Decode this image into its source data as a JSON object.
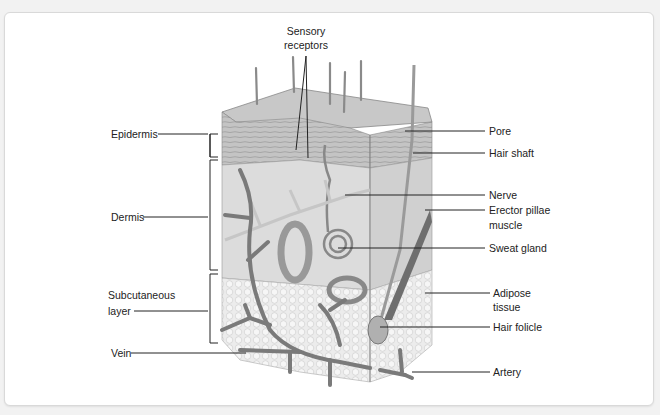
{
  "diagram": {
    "labels": {
      "sensory_receptors_line1": "Sensory",
      "sensory_receptors_line2": "receptors",
      "epidermis": "Epidermis",
      "dermis": "Dermis",
      "subcutaneous_line1": "Subcutaneous",
      "subcutaneous_line2": "layer",
      "vein": "Vein",
      "pore": "Pore",
      "hair_shaft": "Hair shaft",
      "nerve": "Nerve",
      "erector_line1": "Erector pillae",
      "erector_line2": "muscle",
      "sweat_gland": "Sweat gland",
      "adipose_line1": "Adipose",
      "adipose_line2": "tissue",
      "hair_folicle": "Hair folicle",
      "artery": "Artery"
    },
    "colors": {
      "background": "#f2f2f2",
      "card": "#ffffff",
      "epidermis": "#b8b8b8",
      "dermis": "#dcdcdc",
      "adipose": "#ececec",
      "vessel": "#7a7a7a",
      "line": "#222222"
    }
  }
}
